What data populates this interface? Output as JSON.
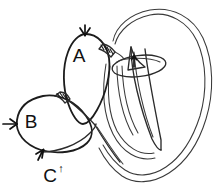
{
  "figure": {
    "background_color": "#ffffff",
    "ink_color": "#2b2b2b",
    "width": 220,
    "height": 192,
    "labels": [
      {
        "id": "A",
        "text": "A",
        "x": 79,
        "y": 62,
        "superscript": ""
      },
      {
        "id": "B",
        "text": "B",
        "x": 31,
        "y": 128,
        "superscript": ""
      },
      {
        "id": "C",
        "text": "C",
        "x": 50,
        "y": 182,
        "superscript": "↑"
      }
    ],
    "annotations": {
      "c_superscript_arrow": "↑",
      "arrow_count": 3,
      "arrows": [
        {
          "name": "arrow-to-a",
          "points_to": "A",
          "direction": "down"
        },
        {
          "name": "arrow-to-b",
          "points_to": "B",
          "direction": "right"
        },
        {
          "name": "arrow-to-c",
          "points_to": "C",
          "direction": "up"
        }
      ]
    },
    "shapes": {
      "oval_a": "upper pear-shaped oval",
      "oval_b": "lower left oval",
      "outer_contour": "large double-line shell outline on the right",
      "blade": "elongated tapering pointed form",
      "ring": "ellipse ring around blade top",
      "hatched_bands": "two short cross-hatched connecting bands"
    }
  }
}
